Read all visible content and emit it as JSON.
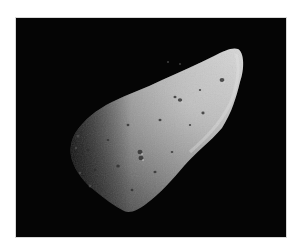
{
  "image": {
    "subject": "asteroid",
    "description": "Grayscale photograph of an elongated cratered asteroid against a black space background",
    "colors": {
      "page_background": "#ffffff",
      "space_background": "#050505",
      "frame_border": "#d8d8d8",
      "surface_highlight": "#d0d0d0",
      "surface_mid": "#8a8a8a",
      "surface_shadow": "#3a3a3a"
    },
    "frame": {
      "x": 15,
      "y": 17,
      "width": 272,
      "height": 221
    }
  }
}
